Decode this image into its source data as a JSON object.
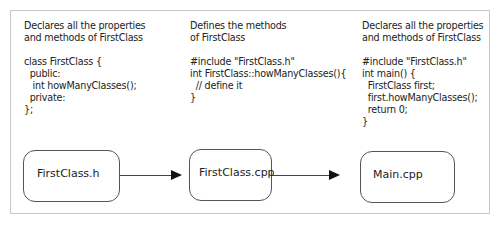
{
  "columns": [
    {
      "description": "Declares all the properties\nand methods of FirstClass",
      "code": "class FirstClass {\n  public:\n   int howManyClasses();\n  private:\n};"
    },
    {
      "description": "Defines the methods\nof FirstClass",
      "code": "#include \"FirstClass.h\"\nint FirstClass::howManyClasses(){\n  // define it\n}"
    },
    {
      "description": "Declares all the properties\nand methods of FirstClass",
      "code": "#include \"FirstClass.h\"\nint main() {\n  FirstClass first;\n  first.howManyClasses();\n  return 0;\n}"
    }
  ],
  "boxes": [
    {
      "label": "FirstClass.h"
    },
    {
      "label": "FirstClass.cpp"
    },
    {
      "label": "Main.cpp"
    }
  ],
  "colors": {
    "frame_border": "#c8c8c8",
    "box_border": "#555555",
    "arrow": "#111111"
  }
}
